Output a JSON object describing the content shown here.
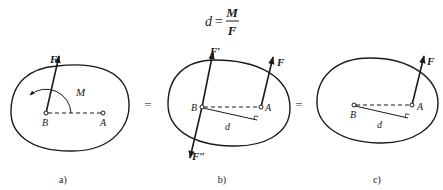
{
  "formula": {
    "lhs": "d",
    "equals": "=",
    "numerator": "M",
    "denominator": "F"
  },
  "equals_signs": [
    "=",
    "="
  ],
  "panels": [
    {
      "id": "a",
      "caption": "a)",
      "labels": {
        "force": "F′",
        "moment": "M",
        "point_b": "B",
        "point_a": "A"
      }
    },
    {
      "id": "b",
      "caption": "b)",
      "labels": {
        "force_top": "F′",
        "force_a": "F",
        "force_bottom": "F″",
        "point_b": "B",
        "point_a": "A",
        "distance": "d"
      }
    },
    {
      "id": "c",
      "caption": "c)",
      "labels": {
        "force_a": "F",
        "point_b": "B",
        "point_a": "A",
        "distance": "d"
      }
    }
  ],
  "colors": {
    "ink": "#1a1a1a",
    "background": "#ffffff"
  }
}
